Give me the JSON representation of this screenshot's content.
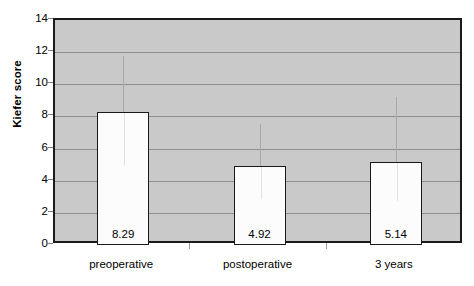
{
  "chart_data": {
    "type": "bar",
    "title": "",
    "xlabel": "",
    "ylabel": "Kiefer score",
    "categories": [
      "preoperative",
      "postoperative",
      "3 years"
    ],
    "values": [
      8.29,
      4.92,
      5.14
    ],
    "value_labels": [
      "8.29",
      "4.92",
      "5.14"
    ],
    "error_bars": [
      {
        "low": 4.95,
        "high": 11.75
      },
      {
        "low": 2.9,
        "high": 7.55
      },
      {
        "low": 2.8,
        "high": 9.2
      }
    ],
    "ylim": [
      0,
      14
    ],
    "yticks": [
      0,
      2,
      4,
      6,
      8,
      10,
      12,
      14
    ],
    "ytick_labels": [
      "0",
      "2",
      "4",
      "6",
      "8",
      "10",
      "12",
      "14"
    ],
    "grid": true,
    "grid_axis": "y",
    "legend": "none",
    "plot_background": "#c9c9c9",
    "bar_fill": "#fcfcfc",
    "bar_edge": "#1a1a1a",
    "gridline_color": "#8f8f8f",
    "error_bar_color": "#a8a8a8"
  }
}
